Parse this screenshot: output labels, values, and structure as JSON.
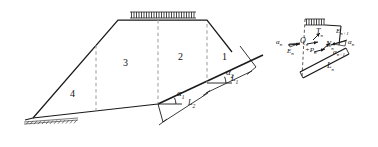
{
  "figure": {
    "line_color": "#1a1a1a",
    "dashed_color": "#9a9a9a",
    "background": "#ffffff"
  },
  "main_diagram": {
    "name": "embankment-cross-section",
    "zones": [
      {
        "id": "zone-1",
        "label": "1"
      },
      {
        "id": "zone-2",
        "label": "2"
      },
      {
        "id": "zone-3",
        "label": "3"
      },
      {
        "id": "zone-4",
        "label": "4"
      }
    ],
    "angles": [
      {
        "id": "alpha-1",
        "symbol": "α",
        "subscript": "1"
      },
      {
        "id": "alpha-2",
        "symbol": "α",
        "subscript": "2"
      }
    ],
    "lengths": [
      {
        "id": "length-1",
        "symbol": "L",
        "subscript": "1"
      },
      {
        "id": "length-2",
        "symbol": "L",
        "subscript": "2"
      }
    ],
    "surcharge_label": "distributed-load-hatching",
    "ground_label": "ground-surface-hatching"
  },
  "free_body_diagram": {
    "name": "slice-force-polygon",
    "forces": [
      {
        "id": "force-T-n",
        "symbol": "T",
        "subscript": "n"
      },
      {
        "id": "force-Q-n",
        "symbol": "Q",
        "subscript": "n"
      },
      {
        "id": "force-N-n",
        "symbol": "N",
        "subscript": "n"
      },
      {
        "id": "force-E-n",
        "symbol": "E",
        "subscript": "n"
      },
      {
        "id": "force-E-n-plus-1",
        "symbol": "E",
        "subscript": "n+1"
      },
      {
        "id": "force-P-n",
        "symbol": "+P",
        "subscript": "n"
      }
    ],
    "angles": [
      {
        "id": "fbd-alpha-n-left",
        "symbol": "α",
        "subscript": "n"
      },
      {
        "id": "fbd-alpha-n-right",
        "symbol": "α",
        "subscript": "n"
      },
      {
        "id": "fbd-alpha-n-plus-1",
        "symbol": "α",
        "subscript": "n+1"
      }
    ],
    "lengths": [
      {
        "id": "fbd-length-L-n",
        "symbol": "L",
        "subscript": "n"
      }
    ],
    "surcharge_label": "slice-top-load-hatching"
  }
}
